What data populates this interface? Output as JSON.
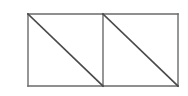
{
  "canvas": {
    "width": 188,
    "height": 96,
    "background": "#ffffff"
  },
  "figure": {
    "name": "rectangle-split-into-two-squares-with-diagonals",
    "frame_color": "#6a6a6a",
    "diagonal_color": "#4a4a4a",
    "frame_stroke_width": 1.4,
    "diagonal_stroke_width": 1.7,
    "bounds": {
      "left": 28,
      "top": 14,
      "right": 178,
      "bottom": 86,
      "width": 150,
      "height": 72
    },
    "divider_x": 103,
    "outline": {
      "top_edge": {
        "x1": 28,
        "y1": 14,
        "x2": 178,
        "y2": 14
      },
      "right_edge": {
        "x1": 178,
        "y1": 14,
        "x2": 178,
        "y2": 86
      },
      "bottom_edge": {
        "x1": 178,
        "y1": 86,
        "x2": 28,
        "y2": 86
      },
      "left_edge": {
        "x1": 28,
        "y1": 86,
        "x2": 28,
        "y2": 14
      }
    },
    "divider": {
      "x1": 103,
      "y1": 14,
      "x2": 103,
      "y2": 86
    },
    "diagonals": [
      {
        "label": "left-cell-diagonal",
        "x1": 28,
        "y1": 14,
        "x2": 103,
        "y2": 86
      },
      {
        "label": "right-cell-diagonal",
        "x1": 103,
        "y1": 14,
        "x2": 178,
        "y2": 86
      }
    ]
  }
}
